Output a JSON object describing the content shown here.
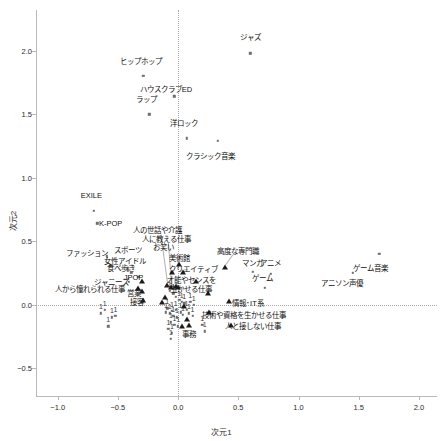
{
  "chart_data": {
    "type": "scatter",
    "title": "",
    "xlabel": "次元1",
    "ylabel": "次元2",
    "xlim": [
      -1.18,
      2.15
    ],
    "ylim": [
      -0.72,
      2.32
    ],
    "xticks": [
      "−1.0",
      "−0.5",
      "0.0",
      "0.5",
      "1.0",
      "1.5",
      "2.0"
    ],
    "xtickvals": [
      -1.0,
      -0.5,
      0.0,
      0.5,
      1.0,
      1.5,
      2.0
    ],
    "yticks": [
      "2.0",
      "1.5",
      "1.0",
      "0.5",
      "0.0",
      "−0.5"
    ],
    "ytickvals": [
      2.0,
      1.5,
      1.0,
      0.5,
      0.0,
      -0.5
    ],
    "grid": false,
    "reference_lines": [
      {
        "axis": "x",
        "value": 0.0,
        "style": "dotted"
      },
      {
        "axis": "y",
        "value": 0.0,
        "style": "dotted"
      }
    ],
    "legend": "none",
    "series": [
      {
        "name": "カテゴリ（趣味・ジャンル）",
        "marker": "square",
        "points": [
          {
            "label": "ジャズ",
            "x": 0.6,
            "y": 1.98,
            "lx": 0.6,
            "ly": 2.11
          },
          {
            "label": "ヒップホップ",
            "x": -0.29,
            "y": 1.8,
            "lx": -0.31,
            "ly": 1.92
          },
          {
            "label": "ハウスクラブED",
            "x": -0.03,
            "y": 1.64,
            "lx": -0.1,
            "ly": 1.7
          },
          {
            "label": "ラップ",
            "x": -0.24,
            "y": 1.5,
            "lx": -0.26,
            "ly": 1.62
          },
          {
            "label": "洋ロック",
            "x": 0.07,
            "y": 1.31,
            "lx": 0.05,
            "ly": 1.43
          },
          {
            "label": "クラシック音楽",
            "x": 0.33,
            "y": 1.29,
            "lx": 0.27,
            "ly": 1.17
          },
          {
            "label": "EXILE",
            "x": -0.7,
            "y": 0.74,
            "lx": -0.72,
            "ly": 0.86
          },
          {
            "label": "K-POP",
            "x": -0.67,
            "y": 0.64,
            "lx": -0.56,
            "ly": 0.64
          },
          {
            "label": "ファッション",
            "x": -0.59,
            "y": 0.38,
            "lx": -0.76,
            "ly": 0.41
          },
          {
            "label": "スポーツ",
            "x": -0.42,
            "y": 0.29,
            "lx": -0.42,
            "ly": 0.43
          },
          {
            "label": "女性アイドル",
            "x": -0.42,
            "y": 0.27,
            "lx": -0.44,
            "ly": 0.34
          },
          {
            "label": "食べ歩き",
            "x": -0.39,
            "y": 0.25,
            "lx": -0.47,
            "ly": 0.29
          },
          {
            "label": "JPOP",
            "x": -0.33,
            "y": 0.22,
            "lx": -0.37,
            "ly": 0.22
          },
          {
            "label": "ジャニーズ",
            "x": -0.41,
            "y": 0.18,
            "lx": -0.55,
            "ly": 0.18
          },
          {
            "label": "マンガ",
            "x": 0.62,
            "y": 0.26,
            "lx": 0.62,
            "ly": 0.33
          },
          {
            "label": "アニメ",
            "x": 0.77,
            "y": 0.24,
            "lx": 0.77,
            "ly": 0.33
          },
          {
            "label": "ゲーム",
            "x": 0.72,
            "y": 0.13,
            "lx": 0.7,
            "ly": 0.21
          },
          {
            "label": "ゲーム音楽",
            "x": 1.67,
            "y": 0.4,
            "lx": 1.6,
            "ly": 0.29
          },
          {
            "label": "アニソン声優",
            "x": 1.45,
            "y": 0.25,
            "lx": 1.36,
            "ly": 0.17
          },
          {
            "label": "1",
            "x": -0.61,
            "y": -0.04
          },
          {
            "label": "1",
            "x": -0.64,
            "y": -0.07
          },
          {
            "label": "1",
            "x": -0.55,
            "y": -0.1
          },
          {
            "label": "1",
            "x": -0.52,
            "y": -0.09
          },
          {
            "label": "1",
            "x": -0.58,
            "y": -0.17
          },
          {
            "label": "1",
            "x": -0.09,
            "y": -0.03
          },
          {
            "label": "1",
            "x": -0.1,
            "y": -0.06
          },
          {
            "label": "1",
            "x": -0.07,
            "y": -0.07
          },
          {
            "label": "1",
            "x": -0.05,
            "y": -0.05
          },
          {
            "label": "1",
            "x": -0.04,
            "y": -0.09
          },
          {
            "label": "1",
            "x": -0.02,
            "y": -0.04
          },
          {
            "label": "1",
            "x": -0.01,
            "y": -0.1
          },
          {
            "label": "1",
            "x": 0.02,
            "y": -0.06
          },
          {
            "label": "1",
            "x": 0.04,
            "y": -0.08
          },
          {
            "label": "1",
            "x": 0.07,
            "y": -0.04
          },
          {
            "label": "1",
            "x": 0.09,
            "y": -0.07
          },
          {
            "label": "1",
            "x": 0.12,
            "y": -0.09
          },
          {
            "label": "1",
            "x": -0.06,
            "y": -0.14
          },
          {
            "label": "1",
            "x": -0.03,
            "y": -0.16
          },
          {
            "label": "1",
            "x": 0.0,
            "y": -0.17
          },
          {
            "label": "1",
            "x": -0.08,
            "y": -0.19
          },
          {
            "label": "1",
            "x": -0.05,
            "y": -0.22
          },
          {
            "label": "1",
            "x": -0.06,
            "y": -0.27
          },
          {
            "label": "1",
            "x": 0.2,
            "y": -0.16
          },
          {
            "label": "1",
            "x": 0.22,
            "y": -0.21
          },
          {
            "label": "1",
            "x": -0.02,
            "y": 0.06
          },
          {
            "label": "1",
            "x": 0.01,
            "y": 0.04
          },
          {
            "label": "1",
            "x": 0.03,
            "y": 0.02
          },
          {
            "label": "1",
            "x": 0.05,
            "y": 0.01
          },
          {
            "label": "1",
            "x": -0.07,
            "y": 0.11
          },
          {
            "label": "1",
            "x": -0.04,
            "y": 0.09
          },
          {
            "label": "1",
            "x": 0.1,
            "y": 0.02
          },
          {
            "label": "1",
            "x": 0.13,
            "y": 0.0
          }
        ]
      },
      {
        "name": "仕事観（職業イメージ）",
        "marker": "triangle",
        "points": [
          {
            "label": "人の世話や介護",
            "x": -0.09,
            "y": 0.15,
            "lx": -0.17,
            "ly": 0.59
          },
          {
            "label": "人に教える仕事",
            "x": -0.06,
            "y": 0.13,
            "lx": -0.1,
            "ly": 0.52
          },
          {
            "label": "お笑い",
            "x": -0.05,
            "y": 0.25,
            "lx": -0.12,
            "ly": 0.45
          },
          {
            "label": "美術館",
            "x": 0.01,
            "y": 0.31,
            "lx": 0.01,
            "ly": 0.37
          },
          {
            "label": "クリエイティブ",
            "x": 0.04,
            "y": 0.25,
            "lx": 0.13,
            "ly": 0.28
          },
          {
            "label": "高度な専門職",
            "x": 0.39,
            "y": 0.29,
            "lx": 0.5,
            "ly": 0.42
          },
          {
            "label": "才能やセンスを",
            "x": 0.0,
            "y": 0.13,
            "lx": 0.11,
            "ly": 0.19
          },
          {
            "label": "生かせる仕事",
            "x": 0.25,
            "y": 0.08,
            "lx": 0.11,
            "ly": 0.12
          },
          {
            "label": "営業",
            "x": -0.3,
            "y": 0.18,
            "lx": -0.37,
            "ly": 0.09
          },
          {
            "label": "接客",
            "x": -0.3,
            "y": 0.1,
            "lx": -0.34,
            "ly": 0.02
          },
          {
            "label": "情報･IT系",
            "x": 0.42,
            "y": 0.02,
            "lx": 0.58,
            "ly": 0.01
          },
          {
            "label": "技術や資格を生かせる仕事",
            "x": 0.26,
            "y": -0.07,
            "lx": 0.55,
            "ly": -0.08
          },
          {
            "label": "人と接しない仕事",
            "x": 0.44,
            "y": -0.17,
            "lx": 0.62,
            "ly": -0.17
          },
          {
            "label": "人から憧れられる仕事",
            "x": -0.33,
            "y": 0.12,
            "lx": -0.73,
            "ly": 0.12
          },
          {
            "label": "事務",
            "x": 0.09,
            "y": -0.17,
            "lx": 0.09,
            "ly": -0.23
          },
          {
            "label": "",
            "x": -0.11,
            "y": 0.05
          },
          {
            "label": "",
            "x": -0.13,
            "y": 0.01
          },
          {
            "label": "",
            "x": -0.02,
            "y": 0.14
          },
          {
            "label": "",
            "x": 0.05,
            "y": -0.02
          },
          {
            "label": "",
            "x": 0.07,
            "y": -0.12
          },
          {
            "label": "",
            "x": 0.03,
            "y": -0.18
          },
          {
            "label": "",
            "x": -0.29,
            "y": 0.03
          },
          {
            "label": "",
            "x": 0.15,
            "y": 0.18
          }
        ]
      }
    ]
  },
  "axes": {
    "x_title": "次元1",
    "y_title": "次元2"
  }
}
